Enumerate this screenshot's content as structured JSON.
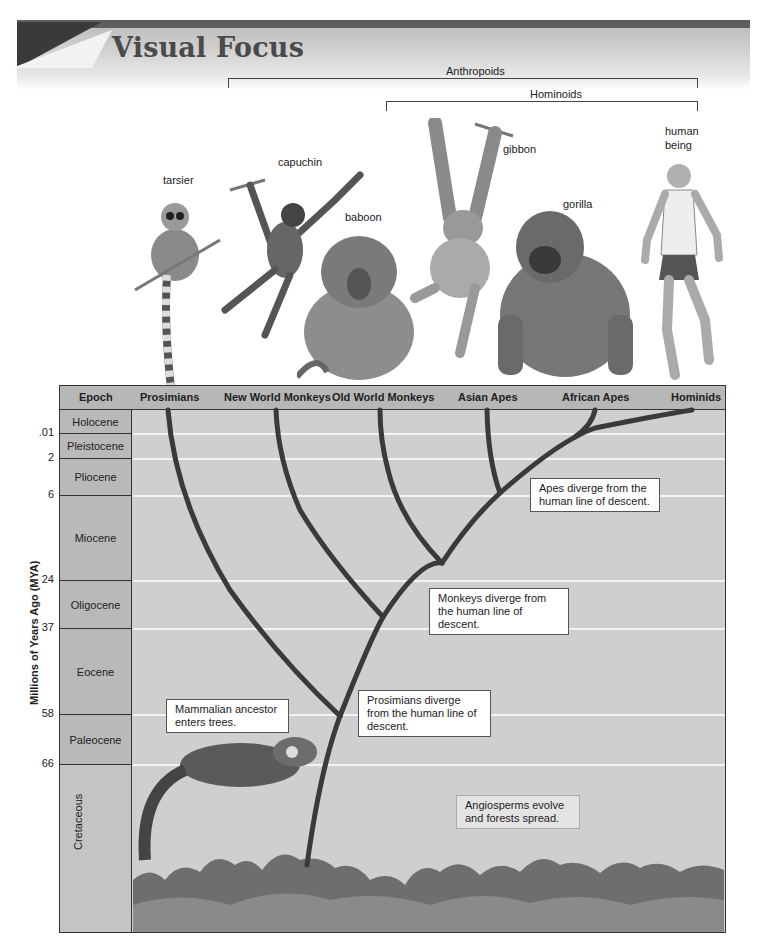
{
  "banner": {
    "title": "Visual Focus"
  },
  "groupings": [
    {
      "label": "Anthropoids",
      "span": "New World Monkeys to Hominids"
    },
    {
      "label": "Hominoids",
      "span": "Asian Apes to Hominids"
    }
  ],
  "animals": [
    {
      "name": "tarsier",
      "icon": "tarsier-illustration"
    },
    {
      "name": "capuchin",
      "icon": "capuchin-illustration"
    },
    {
      "name": "baboon",
      "icon": "baboon-illustration"
    },
    {
      "name": "gibbon",
      "icon": "gibbon-illustration"
    },
    {
      "name": "gorilla",
      "icon": "gorilla-illustration"
    },
    {
      "name_line1": "human",
      "name_line2": "being",
      "icon": "human-runner-illustration"
    }
  ],
  "table": {
    "epoch_header": "Epoch",
    "columns": [
      "Prosimians",
      "New World Monkeys",
      "Old World Monkeys",
      "Asian Apes",
      "African Apes",
      "Hominids"
    ],
    "epochs": [
      "Holocene",
      "Pleistocene",
      "Pliocene",
      "Miocene",
      "Oligocene",
      "Eocene",
      "Paleocene",
      "Cretaceous"
    ],
    "axis_title": "Millions of Years Ago (MYA)",
    "ticks": [
      ".01",
      "2",
      "6",
      "24",
      "37",
      "58",
      "66"
    ]
  },
  "annotations": {
    "apes": "Apes diverge from the human line of descent.",
    "monkeys": "Monkeys diverge from the human line of descent.",
    "prosimians": "Prosimians diverge from the human line of descent.",
    "mammalian": "Mammalian ancestor enters trees.",
    "angiosperms": "Angiosperms evolve and forests spread."
  },
  "illustrations": {
    "ancestor": "tree-shrew-ancestor-illustration",
    "forest": "forest-canopy-illustration"
  },
  "colors": {
    "panel": "#cfcfcf",
    "header": "#b7b7b7",
    "branch": "#3c3c3c",
    "gridline": "#f3f3f3"
  }
}
